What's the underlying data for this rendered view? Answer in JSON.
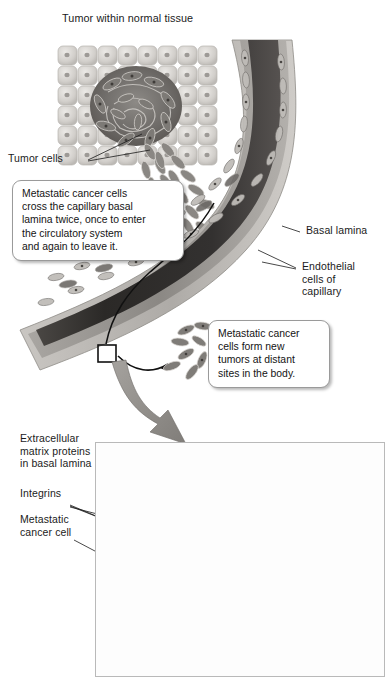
{
  "figure": {
    "title_bracket_label": "Tumor within normal tissue",
    "labels": {
      "tumor_cells": "Tumor cells",
      "basal_lamina": "Basal lamina",
      "endothelial_cells": "Endothelial\ncells of\ncapillary",
      "ecm_proteins": "Extracellular\nmatrix proteins\nin basal lamina",
      "integrins": "Integrins",
      "metastatic_cancer_cell": "Metastatic\ncancer cell"
    },
    "callouts": {
      "capillary_crossing": "Metastatic cancer cells\ncross the capillary basal\nlamina twice, once to enter\nthe circulatory system\nand again to leave it.",
      "distant_tumors": "Metastatic cancer\ncells form new\ntumors at distant\nsites in the body.",
      "integrin_crossing": "Some metastatic\ncancer cells cross\nthe basal lamina by\nmeans of specific\ntypes of integrins."
    },
    "colors": {
      "ink": "#1b1b1b",
      "callout_border": "#9a9a9a",
      "panel_border": "#b9b9b9",
      "lumen_dark": "#2e2c2b",
      "vessel_wall": "#8e8b88",
      "basal_lamina_band": "#b5b2ae",
      "tumor_mass": "#6f6c69",
      "normal_tissue": "#d9d7d4",
      "arrow_gray": "#8d8a86",
      "mesh_fiber": "#8a8784",
      "cell_protrusion": "#b0adaa"
    }
  }
}
